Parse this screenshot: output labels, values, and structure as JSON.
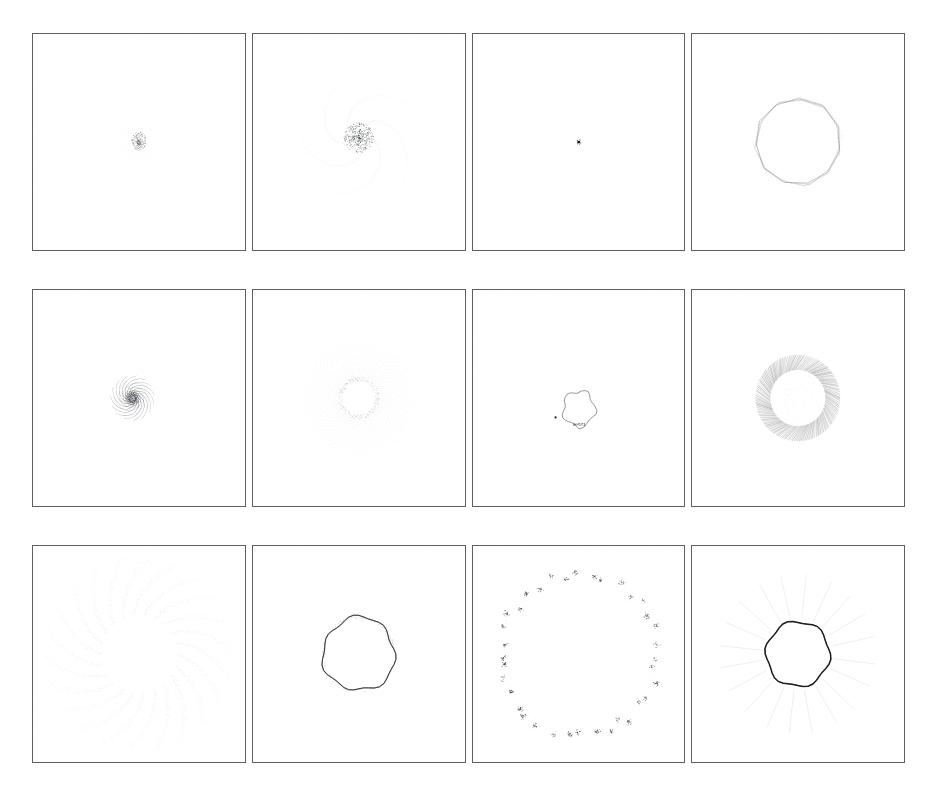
{
  "figure": {
    "layout": {
      "rows": 3,
      "columns": 4,
      "panel_count": 12
    },
    "background_color": "#ffffff",
    "border_color": "#5d5f63",
    "ink_color": "#1a1a1a",
    "faint_ink_color": "#9aa0a6"
  },
  "chart_data": {
    "type": "scatter",
    "xlabel": "",
    "ylabel": "",
    "grid": false,
    "legend": null,
    "layout": {
      "rows": 3,
      "columns": 4
    },
    "panels": [
      {
        "index": 1,
        "row": 1,
        "column": 1,
        "label": "",
        "motif": "compact-core-with-faint-radial-halo",
        "center": [
          0.5,
          0.5
        ],
        "core_radius": 0.035,
        "halo_radius": 0.26,
        "ray_count": 36,
        "point_count": 900,
        "density": "very-low",
        "ink": "light"
      },
      {
        "index": 2,
        "row": 1,
        "column": 2,
        "label": "",
        "motif": "scattered-core-cluster-with-spiral-halo",
        "center": [
          0.5,
          0.48
        ],
        "core_radius": 0.07,
        "halo_radius": 0.3,
        "arm_count": 5,
        "point_count": 1400,
        "density": "low",
        "ink": "medium"
      },
      {
        "index": 3,
        "row": 1,
        "column": 3,
        "label": "",
        "motif": "single-collapsed-point",
        "center": [
          0.5,
          0.5
        ],
        "core_radius": 0.012,
        "halo_radius": 0.1,
        "point_count": 220,
        "density": "minimal",
        "ink": "dark-core"
      },
      {
        "index": 4,
        "row": 1,
        "column": 4,
        "label": "",
        "motif": "polygonal-ring-outline",
        "center": [
          0.5,
          0.5
        ],
        "ring_radius": 0.2,
        "polygon_sides": 11,
        "ring_thickness": 0.012,
        "point_count": 600,
        "density": "low",
        "ink": "medium"
      },
      {
        "index": 5,
        "row": 2,
        "column": 1,
        "label": "",
        "motif": "multi-arm-logarithmic-spiral",
        "center": [
          0.47,
          0.5
        ],
        "arm_count": 5,
        "spiral_growth": 0.26,
        "max_radius": 0.47,
        "point_count": 2600,
        "density": "medium",
        "ink": "light"
      },
      {
        "index": 6,
        "row": 2,
        "column": 2,
        "label": "",
        "motif": "rosette-sunburst-with-hollow-core",
        "center": [
          0.5,
          0.5
        ],
        "core_radius": 0.085,
        "outer_radius": 0.27,
        "spoke_count": 60,
        "point_count": 2400,
        "density": "medium",
        "ink": "light"
      },
      {
        "index": 7,
        "row": 2,
        "column": 3,
        "label": "",
        "motif": "small-closed-blob-with-satellite-dot",
        "center": [
          0.5,
          0.55
        ],
        "blob_radius": 0.075,
        "satellite": [
          0.39,
          0.59
        ],
        "point_count": 400,
        "density": "low",
        "ink": "dark"
      },
      {
        "index": 8,
        "row": 2,
        "column": 4,
        "label": "",
        "motif": "hatched-annulus",
        "center": [
          0.5,
          0.5
        ],
        "inner_radius": 0.13,
        "outer_radius": 0.2,
        "hatch_count": 150,
        "point_count": 1800,
        "density": "high",
        "ink": "dark"
      },
      {
        "index": 9,
        "row": 3,
        "column": 1,
        "label": "",
        "motif": "broad-dotted-pinwheel-annulus",
        "center": [
          0.5,
          0.5
        ],
        "inner_radius": 0.18,
        "outer_radius": 0.45,
        "arm_count": 22,
        "point_count": 3000,
        "density": "medium",
        "ink": "very-light"
      },
      {
        "index": 10,
        "row": 3,
        "column": 2,
        "label": "",
        "motif": "bold-wobbly-ring-outline",
        "center": [
          0.5,
          0.5
        ],
        "ring_radius": 0.17,
        "ring_thickness": 0.018,
        "point_count": 700,
        "density": "medium",
        "ink": "very-dark"
      },
      {
        "index": 11,
        "row": 3,
        "column": 3,
        "label": "",
        "motif": "clumped-ring-of-blobs",
        "center": [
          0.5,
          0.5
        ],
        "ring_radius": 0.37,
        "clump_count": 36,
        "point_count": 1500,
        "density": "clustered",
        "ink": "dark"
      },
      {
        "index": 12,
        "row": 3,
        "column": 4,
        "label": "",
        "motif": "thick-ring-with-radial-jets",
        "center": [
          0.5,
          0.5
        ],
        "ring_radius": 0.15,
        "ring_thickness": 0.022,
        "jet_count": 20,
        "jet_length": 0.22,
        "point_count": 1600,
        "density": "medium",
        "ink": "dark"
      }
    ]
  }
}
